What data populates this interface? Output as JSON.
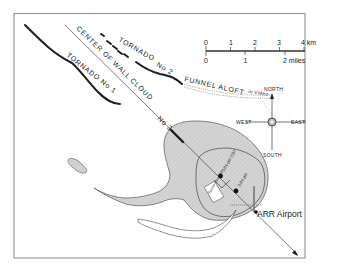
{
  "colors": {
    "frame": "#9a9a9a",
    "ink": "#1e1e1e",
    "echo_fill": "#d2d2d2",
    "echo_stroke": "#555555",
    "background": "#ffffff"
  },
  "labels": {
    "tornado_1": "TORNADO No 1",
    "tornado_2": "TORNADO",
    "tornado_2_no": "No 2",
    "wall_cloud": "CENTER OF WALL CLOUD",
    "tornado_3_no": "No 3",
    "funnel_aloft": "FUNNEL ALOFT",
    "in_video": "in Video",
    "airport": "ARR Airport",
    "time_1": "3:04 pm CDT",
    "time_2": "3:04 pm",
    "box_note": "Funnel observed"
  },
  "compass": {
    "north": "NORTH",
    "south": "SOUTH",
    "east": "EAST",
    "west": "WEST"
  },
  "scale_bar": {
    "km_ticks": [
      "0",
      "1",
      "2",
      "3",
      "4 km"
    ],
    "mile_ticks": [
      "0",
      "1",
      "2 miles"
    ]
  }
}
